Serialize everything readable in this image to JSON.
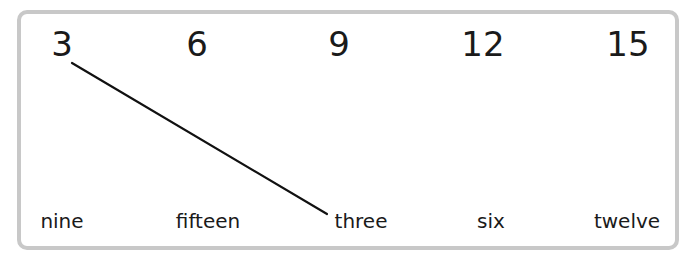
{
  "activity": {
    "type": "match-numbers-to-words",
    "numbers": [
      "3",
      "6",
      "9",
      "12",
      "15"
    ],
    "words": [
      "nine",
      "fifteen",
      "three",
      "six",
      "twelve"
    ],
    "connections": [
      {
        "from_number": "3",
        "to_word": "three"
      }
    ]
  },
  "colors": {
    "border": "#c8c8c8",
    "text": "#1a1a1a",
    "line": "#111111"
  }
}
